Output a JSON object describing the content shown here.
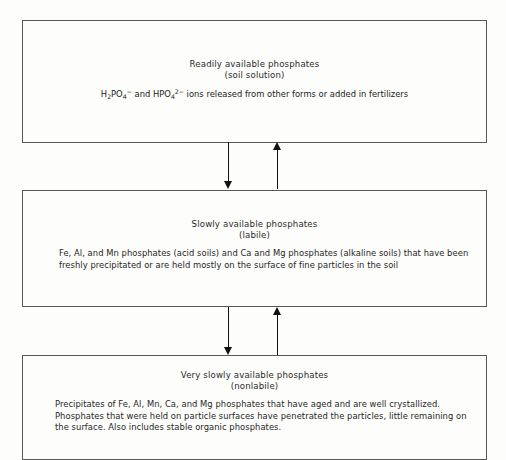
{
  "diagram": {
    "stroke_color": "#58585a",
    "arrow_color": "#111111",
    "background_color": "#fdfdfb",
    "boxes": [
      {
        "id": "readily-available",
        "heading": "Readily available phosphates",
        "subheading": "(soil solution)",
        "formula": {
          "segment_1": "H",
          "segment_1_sub": "2",
          "segment_2": "PO",
          "segment_2_sub": "4",
          "segment_2_sup": "−",
          "connector": " and ",
          "segment_3": "HPO",
          "segment_3_sub": "4",
          "segment_3_sup": "2−",
          "tail": " ions released from other forms or added in fertilizers"
        }
      },
      {
        "id": "slowly-available",
        "heading": "Slowly available phosphates",
        "subheading": "(labile)",
        "body": "Fe, Al, and Mn phosphates (acid soils) and Ca and Mg phosphates (alkaline soils) that have been freshly precipitated or are held mostly on the surface of fine particles in the soil"
      },
      {
        "id": "very-slowly-available",
        "heading": "Very slowly available phosphates",
        "subheading": "(nonlabile)",
        "body": "Precipitates of Fe, Al, Mn, Ca, and Mg phosphates that have aged and are well crystallized. Phosphates that were held on particle surfaces have  penetrated the particles, little remaining on the surface.  Also includes stable organic phosphates."
      }
    ],
    "arrows": [
      {
        "id": "arrow-down-top",
        "direction": "down",
        "icon": "arrow-down-icon"
      },
      {
        "id": "arrow-up-top",
        "direction": "up",
        "icon": "arrow-up-icon"
      },
      {
        "id": "arrow-down-bottom",
        "direction": "down",
        "icon": "arrow-down-icon"
      },
      {
        "id": "arrow-up-bottom",
        "direction": "up",
        "icon": "arrow-up-icon"
      }
    ]
  }
}
